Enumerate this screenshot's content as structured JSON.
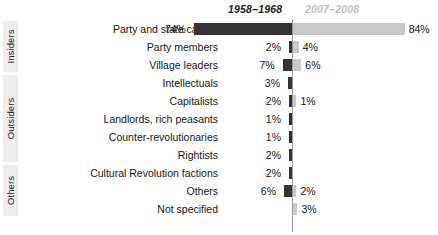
{
  "chart_data": {
    "type": "bar",
    "title": "",
    "xlabel": "",
    "ylabel": "",
    "orientation": "horizontal-diverging",
    "grid": false,
    "legend_position": "top",
    "axis_center_percent": 0,
    "max_percent": 84,
    "series": [
      {
        "name": "1958–1968",
        "color": "#333333",
        "side": "left",
        "values": [
          74,
          2,
          7,
          3,
          2,
          1,
          1,
          2,
          2,
          6,
          null
        ]
      },
      {
        "name": "2007–2008",
        "color": "#c9c9c9",
        "side": "right",
        "values": [
          84,
          4,
          6,
          null,
          1,
          null,
          null,
          null,
          null,
          2,
          3
        ]
      }
    ],
    "categories": [
      "Party and state cadres",
      "Party members",
      "Village leaders",
      "Intellectuals",
      "Capitalists",
      "Landlords, rich peasants",
      "Counter-revolutionaries",
      "Rightists",
      "Cultural Revolution factions",
      "Others",
      "Not specified"
    ],
    "value_labels_left": [
      "74%",
      "2%",
      "7%",
      "3%",
      "2%",
      "1%",
      "1%",
      "2%",
      "2%",
      "6%",
      ""
    ],
    "value_labels_right": [
      "84%",
      "4%",
      "6%",
      "",
      "1%",
      "",
      "",
      "",
      "",
      "2%",
      "3%"
    ],
    "groups": [
      {
        "label": "Insiders",
        "first_row": 0,
        "last_row": 2
      },
      {
        "label": "Outsiders",
        "first_row": 3,
        "last_row": 7
      },
      {
        "label": "Others",
        "first_row": 8,
        "last_row": 10
      }
    ]
  },
  "legend": {
    "left_label": "1958–1968",
    "right_label": "2007–2008"
  },
  "colors": {
    "series_left": "#333333",
    "series_right": "#c9c9c9",
    "axis": "#9a9a9a",
    "group_band": "#ededed",
    "text": "#151515",
    "legend_right_text": "#bfbfbf"
  }
}
